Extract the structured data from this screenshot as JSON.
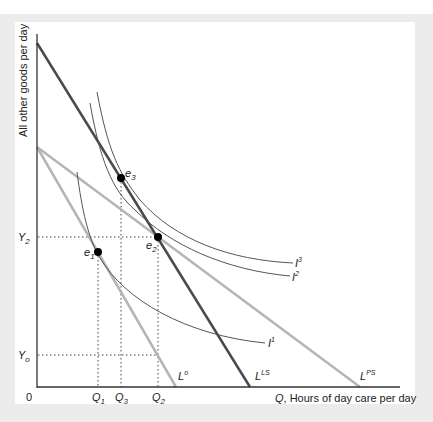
{
  "diagram": {
    "y_axis_label": "All other goods per day",
    "x_axis_label_var": "Q",
    "x_axis_label_rest": ", Hours of day care per day",
    "origin_label": "0",
    "y_ticks": [
      {
        "base": "Y",
        "sub": "2",
        "id": "Y2"
      },
      {
        "base": "Y",
        "sub": "o",
        "id": "Yo"
      }
    ],
    "x_ticks": [
      {
        "base": "Q",
        "sub": "1",
        "id": "Q1"
      },
      {
        "base": "Q",
        "sub": "3",
        "id": "Q3"
      },
      {
        "base": "Q",
        "sub": "2",
        "id": "Q2"
      }
    ],
    "budget_lines": [
      {
        "id": "Lo",
        "base": "L",
        "sup": "o",
        "color": "#b5b5b5"
      },
      {
        "id": "LLS",
        "base": "L",
        "sup": "LS",
        "color": "#4a4a4a"
      },
      {
        "id": "LPS",
        "base": "L",
        "sup": "PS",
        "color": "#b5b5b5"
      }
    ],
    "indifference_curves": [
      {
        "id": "I1",
        "base": "I",
        "sup": "1"
      },
      {
        "id": "I2",
        "base": "I",
        "sup": "2"
      },
      {
        "id": "I3",
        "base": "I",
        "sup": "3"
      }
    ],
    "equilibria": [
      {
        "id": "e1",
        "base": "e",
        "sub": "1"
      },
      {
        "id": "e2",
        "base": "e",
        "sub": "2"
      },
      {
        "id": "e3",
        "base": "e",
        "sub": "3"
      }
    ],
    "colors": {
      "axis": "#333333",
      "light_line": "#b5b5b5",
      "dark_line": "#4a4a4a",
      "curve": "#555555",
      "dot": "#000000",
      "background": "#ececec"
    }
  }
}
